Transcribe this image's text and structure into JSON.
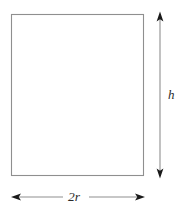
{
  "figure": {
    "type": "geometry-diagram",
    "shape": {
      "name": "rectangle",
      "stroke_color": "#8f8f8f",
      "fill_color": "#ffffff",
      "x": 11,
      "y": 14,
      "width": 133,
      "height": 162
    },
    "dimensions": [
      {
        "name": "height-dimension",
        "label": "h",
        "orientation": "vertical",
        "arrow_style": "double-headed",
        "position": "right",
        "line_color": "#8f8f8f",
        "head_color": "#1a1a1a",
        "x": 160,
        "y_start": 13,
        "y_end": 177
      },
      {
        "name": "width-dimension",
        "label": "2r",
        "orientation": "horizontal",
        "arrow_style": "double-headed",
        "position": "bottom",
        "line_color": "#8f8f8f",
        "head_color": "#1a1a1a",
        "y": 197,
        "x_start": 12,
        "x_end": 144,
        "label_gap_start": 64,
        "label_gap_end": 88
      }
    ]
  },
  "labels": {
    "height": "h",
    "width": "2r"
  },
  "colors": {
    "background": "#ffffff",
    "stroke": "#8f8f8f",
    "arrowhead": "#1a1a1a",
    "text": "#2b2b2b"
  }
}
